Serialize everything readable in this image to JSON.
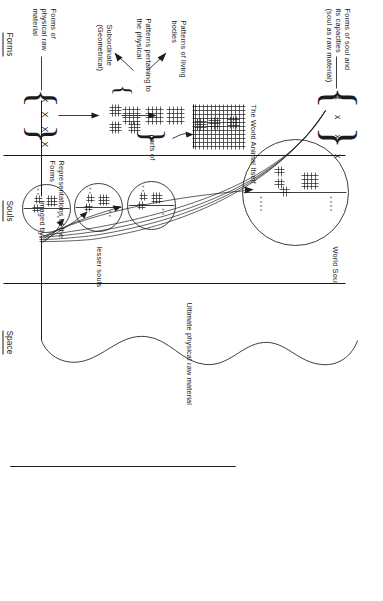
{
  "diagram": {
    "orientation": "rotated-90"
  },
  "sections": [
    {
      "id": "forms",
      "label": "Forms"
    },
    {
      "id": "souls",
      "label": "Souls"
    },
    {
      "id": "space",
      "label": "Space"
    }
  ],
  "labels": {
    "forms_of_physical_raw_material": "Forms of\nphysical raw\nmaterial",
    "forms_of_soul": "Forms of soul and\nits capacities\n(soul as raw material)",
    "patterns_pertaining": "Patterns pertaining to\nthe physical",
    "patterns_of_living_bodies": "Patterns of living\nbodies",
    "subordinate_geometrical": "Subordinate\n(Geometrical)",
    "parts_of": "parts of",
    "the_world_animal_itself": "The World Animal Itself",
    "representations_of_the_forms": "Representations of the\nForms",
    "imaged_by": "imaged by",
    "world_soul": "World Soul",
    "lesser_souls": "lesser souls",
    "ultimate_physical_raw_material": "Ultimate physical raw material"
  },
  "form_tokens": {
    "physical_raw_material": "X X X X",
    "soul_raw_material": "x  x  x  x"
  },
  "soul_contents": {
    "world_soul_marks_top": "x x x x",
    "world_soul_marks_bottom": "x x x x",
    "lesser_soul_marks_top": "x x",
    "lesser_soul_marks_bottom": "x x"
  },
  "colors": {
    "ink": "#1c1c1c",
    "paper": "#ffffff"
  }
}
